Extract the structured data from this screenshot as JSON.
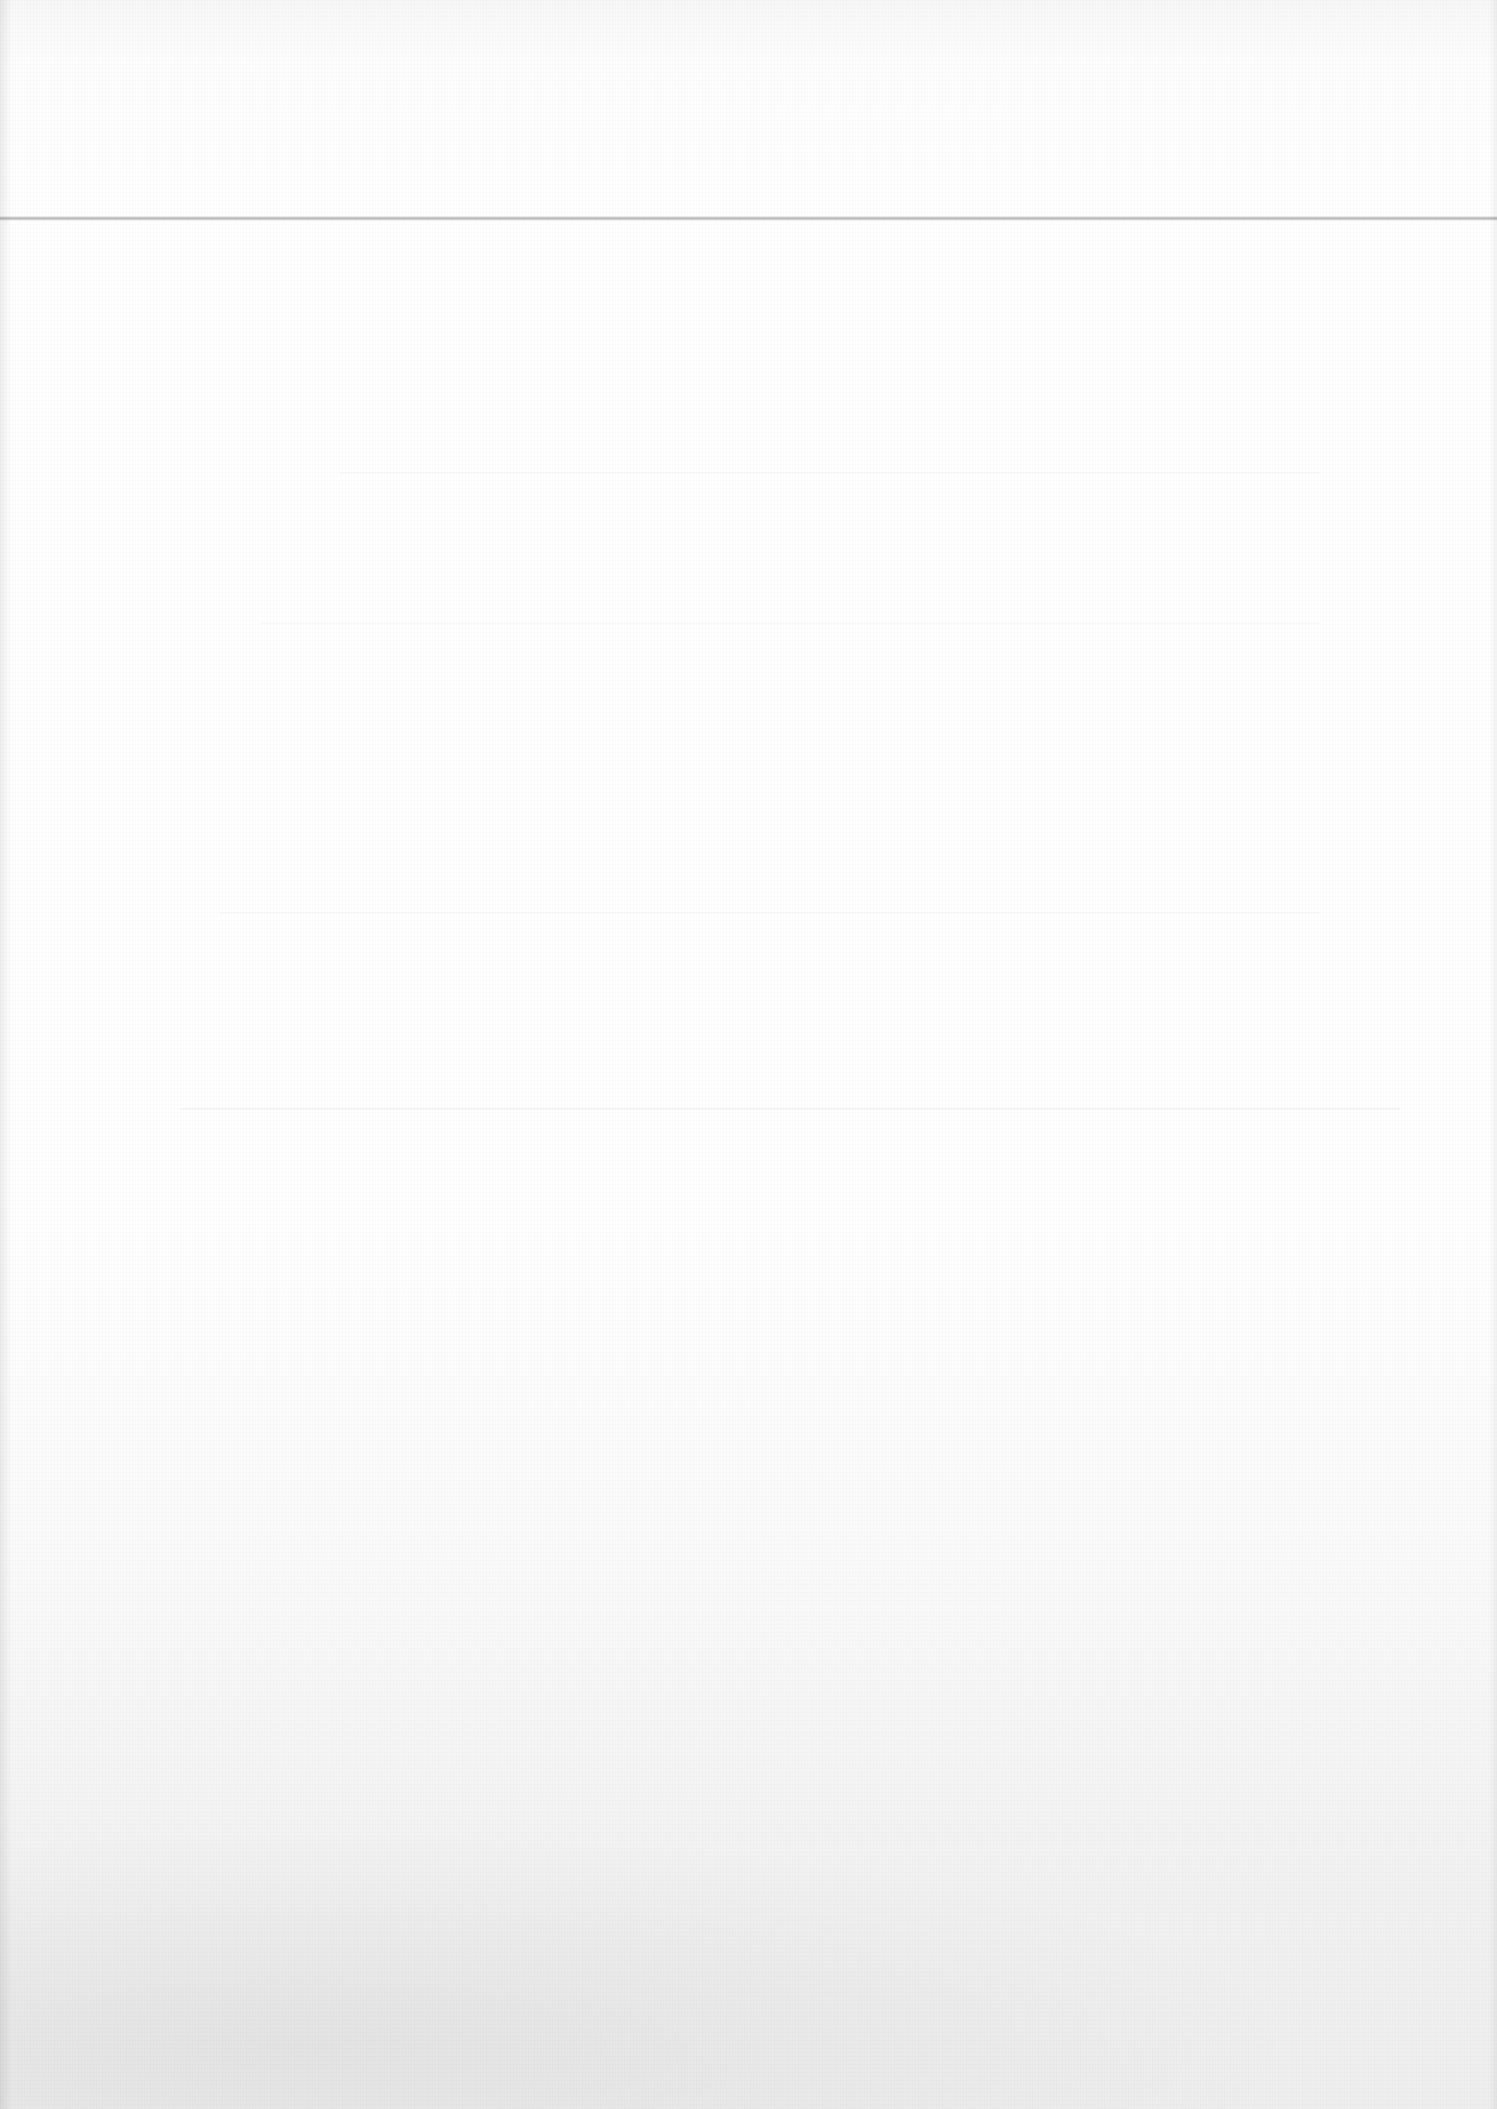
{
  "document": {
    "type": "blank-scanned-page",
    "text_content": [],
    "colors": {
      "paper": "#ffffff",
      "paper_bottom": "#eeeeee",
      "fold_line": "#b8b8b8"
    },
    "features": {
      "fold_line_y": 218
    }
  }
}
